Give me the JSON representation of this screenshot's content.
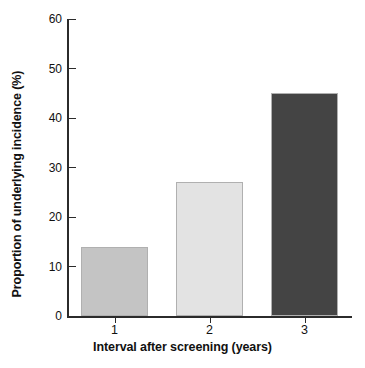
{
  "chart_data": {
    "type": "bar",
    "title": "",
    "categories": [
      "1",
      "2",
      "3"
    ],
    "values": [
      14,
      27,
      45
    ],
    "series": [
      {
        "name": "Proportion of underlying incidence (%)",
        "values": [
          14,
          27,
          45
        ]
      }
    ],
    "xlabel": "Interval after screening (years)",
    "ylabel": "Proportion of underlying incidence (%)",
    "ylim": [
      0,
      60
    ],
    "ytick_labels": [
      "0",
      "10",
      "20",
      "30",
      "40",
      "50",
      "60"
    ],
    "ytick_values": [
      0,
      10,
      20,
      30,
      40,
      50,
      60
    ],
    "xtick_labels": [
      "1",
      "2",
      "3"
    ],
    "grid": false,
    "legend": "none",
    "bar_colors": [
      "#c4c4c4",
      "#e3e3e3",
      "#444444"
    ],
    "bar_edge_color": "#b0b0b0",
    "axis_color": "#2b2b2b",
    "background_color": "#ffffff",
    "text_color": "#111111"
  },
  "axes": {
    "y_title": "Proportion of underlying incidence (%)",
    "x_title": "Interval after screening (years)"
  }
}
